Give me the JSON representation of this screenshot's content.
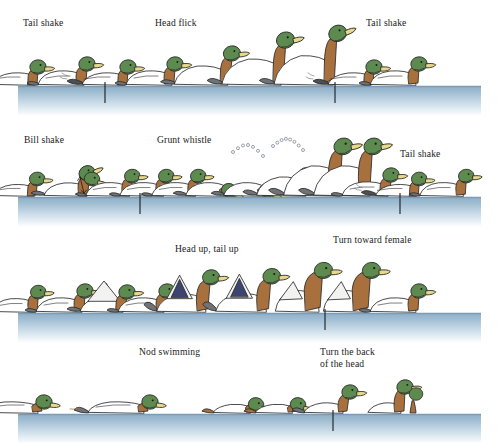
{
  "figure": {
    "background_color": "#ffffff",
    "water": {
      "top_edge_color": "#7b9cb8",
      "gradient_top_color": "#8fb0c8",
      "gradient_bottom_color": "#ffffff",
      "left_x": 18,
      "right_x": 481,
      "band_height": 30
    },
    "duck_colors": {
      "head": "#5d8a4e",
      "head_shadow": "#4a7340",
      "bill": "#e8d98a",
      "bill_shadow": "#cbb85e",
      "breast": "#a8703d",
      "breast_shadow": "#8d5a2d",
      "body": "#ffffff",
      "body_shade": "#f2f2f0",
      "tail": "#6f7377",
      "tail_dark": "#4c5055",
      "speculum": "#3c4470",
      "outline": "#2b2b2b",
      "eye": "#1a1a1a"
    },
    "tick_color": "#1b1b1b"
  },
  "rows": [
    {
      "id": "row-1",
      "waterline_y": 86,
      "labels": [
        {
          "text": "Tail shake",
          "x": 23,
          "y": 26,
          "anchor": "start",
          "lines": [
            "Tail shake"
          ]
        },
        {
          "text": "Head flick",
          "x": 155,
          "y": 26,
          "anchor": "start",
          "lines": [
            "Head flick"
          ]
        },
        {
          "text": "Tail shake",
          "x": 366,
          "y": 26,
          "anchor": "start",
          "lines": [
            "Tail shake"
          ]
        }
      ],
      "ticks": [
        105,
        335
      ],
      "ducks": [
        {
          "pose": "tail-shake",
          "x": 22,
          "scale": 1.0
        },
        {
          "pose": "rest",
          "x": 72,
          "scale": 1.0
        },
        {
          "pose": "tail-shake",
          "x": 112,
          "scale": 1.0
        },
        {
          "pose": "rest",
          "x": 160,
          "scale": 1.0
        },
        {
          "pose": "head-flick-low",
          "x": 212,
          "scale": 1.05
        },
        {
          "pose": "head-flick-high",
          "x": 262,
          "scale": 1.12
        },
        {
          "pose": "head-flick-top",
          "x": 312,
          "scale": 1.12
        },
        {
          "pose": "tail-shake",
          "x": 358,
          "scale": 1.0
        },
        {
          "pose": "rest",
          "x": 404,
          "scale": 1.0
        }
      ]
    },
    {
      "id": "row-2",
      "waterline_y": 197,
      "labels": [
        {
          "text": "Bill shake",
          "x": 24,
          "y": 143,
          "anchor": "start",
          "lines": [
            "Bill shake"
          ]
        },
        {
          "text": "Grunt whistle",
          "x": 157,
          "y": 143,
          "anchor": "start",
          "lines": [
            "Grunt whistle"
          ]
        },
        {
          "text": "Tail shake",
          "x": 400,
          "y": 157,
          "anchor": "start",
          "lines": [
            "Tail shake"
          ]
        }
      ],
      "ticks": [
        140,
        400
      ],
      "ducks": [
        {
          "pose": "tail-shake",
          "x": 22,
          "scale": 0.95
        },
        {
          "pose": "bill-shake",
          "x": 74,
          "scale": 1.0
        },
        {
          "pose": "rest",
          "x": 118,
          "scale": 0.95
        },
        {
          "pose": "rest",
          "x": 152,
          "scale": 0.95
        },
        {
          "pose": "rest",
          "x": 184,
          "scale": 0.95
        },
        {
          "pose": "grunt-down",
          "x": 214,
          "scale": 0.95
        },
        {
          "pose": "grunt-down",
          "x": 252,
          "scale": 0.95
        },
        {
          "pose": "grunt-rise",
          "x": 288,
          "scale": 1.05
        },
        {
          "pose": "grunt-peak",
          "x": 318,
          "scale": 1.15
        },
        {
          "pose": "grunt-peak",
          "x": 348,
          "scale": 1.15
        },
        {
          "pose": "rest",
          "x": 376,
          "scale": 1.0
        },
        {
          "pose": "tail-shake",
          "x": 404,
          "scale": 0.95
        },
        {
          "pose": "rest",
          "x": 452,
          "scale": 0.95
        }
      ],
      "whistle_arcs": [
        {
          "cx": 248,
          "cy": 152,
          "bubbles": 7
        },
        {
          "cx": 288,
          "cy": 146,
          "bubbles": 8
        }
      ]
    },
    {
      "id": "row-3",
      "waterline_y": 313,
      "labels": [
        {
          "text": "Head up, tail up",
          "x": 175,
          "y": 252,
          "anchor": "start",
          "lines": [
            "Head up, tail up"
          ]
        },
        {
          "text": "Turn toward female",
          "x": 333,
          "y": 243,
          "anchor": "start",
          "lines": [
            "Turn toward female"
          ]
        }
      ],
      "ticks": [
        325
      ],
      "ducks": [
        {
          "pose": "rest-low",
          "x": 24,
          "scale": 0.95
        },
        {
          "pose": "rest",
          "x": 70,
          "scale": 1.0
        },
        {
          "pose": "wing-lift",
          "x": 110,
          "scale": 1.0
        },
        {
          "pose": "rest",
          "x": 152,
          "scale": 1.0
        },
        {
          "pose": "head-up-tail-up",
          "x": 188,
          "scale": 1.05
        },
        {
          "pose": "head-up-tail-up",
          "x": 248,
          "scale": 1.08
        },
        {
          "pose": "turn-toward",
          "x": 300,
          "scale": 1.12
        },
        {
          "pose": "turn-toward",
          "x": 348,
          "scale": 1.12
        },
        {
          "pose": "rest",
          "x": 404,
          "scale": 1.0
        }
      ]
    },
    {
      "id": "row-4",
      "waterline_y": 414,
      "labels": [
        {
          "text": "Nod swimming",
          "x": 139,
          "y": 355,
          "anchor": "start",
          "lines": [
            "Nod swimming"
          ]
        },
        {
          "text": "Turn the back of the head",
          "x": 320,
          "y": 355,
          "anchor": "start",
          "lines": [
            "Turn the back",
            "of the head"
          ]
        }
      ],
      "ticks": [
        333
      ],
      "ducks": [
        {
          "pose": "nod-swim",
          "x": 22,
          "scale": 1.0
        },
        {
          "pose": "nod-swim",
          "x": 128,
          "scale": 1.0
        },
        {
          "pose": "nod-swim-low",
          "x": 238,
          "scale": 0.95
        },
        {
          "pose": "nod-swim-low",
          "x": 280,
          "scale": 0.95
        },
        {
          "pose": "back-of-head",
          "x": 330,
          "scale": 1.0
        },
        {
          "pose": "back-of-head-pair",
          "x": 390,
          "scale": 1.0
        }
      ]
    }
  ]
}
